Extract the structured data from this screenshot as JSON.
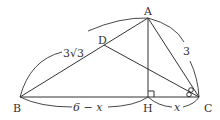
{
  "diagram": {
    "type": "geometry-triangle",
    "points": {
      "A": "A",
      "B": "B",
      "C": "C",
      "D": "D",
      "H": "H"
    },
    "measures": {
      "AB": "3√3",
      "AC": "3",
      "BH": "6 − x",
      "HC": "x"
    },
    "annotations": {
      "right_angle_at": "H",
      "equal_angles_at": "C",
      "equal_angles_marker": "ring-pair"
    },
    "segments": [
      "AB",
      "AC",
      "BC",
      "AH",
      "DC"
    ]
  }
}
